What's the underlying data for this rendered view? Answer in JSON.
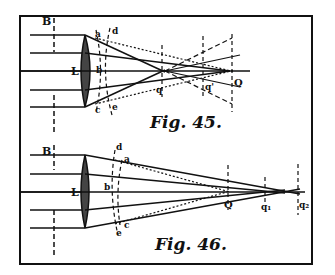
{
  "figures": [
    {
      "caption": "Fig. 45.",
      "labels": {
        "stop": "B",
        "lens": "L",
        "a": "a",
        "b": "b",
        "c": "c",
        "d": "d",
        "e": "e",
        "focus": "q",
        "q1": "q'",
        "Q": "Q"
      }
    },
    {
      "caption": "Fig. 46.",
      "labels": {
        "stop": "B",
        "lens": "L",
        "a": "a",
        "b": "b",
        "c": "c",
        "d": "d",
        "e": "e",
        "Q": "Q",
        "q1": "q₁",
        "q2": "q₂"
      }
    }
  ]
}
